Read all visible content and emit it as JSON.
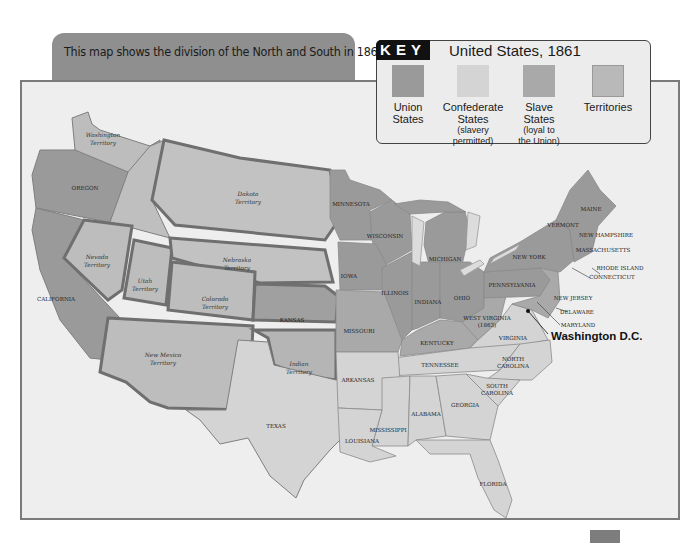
{
  "caption": "This map shows the division of the North and South in 1861.",
  "key": {
    "badge": "KEY",
    "title": "United States, 1861",
    "items": [
      {
        "label": "Union",
        "label2": "States",
        "sub": "",
        "sub2": "",
        "color": "#9a9a9a"
      },
      {
        "label": "Confederate",
        "label2": "States",
        "sub": "(slavery",
        "sub2": "permitted)",
        "color": "#d4d4d4"
      },
      {
        "label": "Slave",
        "label2": "States",
        "sub": "(loyal to",
        "sub2": "the Union)",
        "color": "#a9a9a9"
      },
      {
        "label": "Territories",
        "label2": "",
        "sub": "",
        "sub2": "",
        "color": "#b9b9b9"
      }
    ]
  },
  "colors": {
    "union": "#9a9a9a",
    "confederate": "#d4d4d4",
    "slave_loyal": "#a9a9a9",
    "territories": "#b9b9b9",
    "background": "#eeeeee",
    "border": "#7a7a7a"
  },
  "map": {
    "territories": {
      "washington": [
        "Washington",
        "Territory"
      ],
      "dakota": [
        "Dakota",
        "Territory"
      ],
      "nebraska": [
        "Nebraska",
        "Territory"
      ],
      "nevada": [
        "Nevada",
        "Territory"
      ],
      "utah": [
        "Utah",
        "Territory"
      ],
      "colorado": [
        "Colorado",
        "Territory"
      ],
      "new_mexico": [
        "New Mexico",
        "Territory"
      ],
      "indian": [
        "Indian",
        "Territory"
      ]
    },
    "states": {
      "oregon": "OREGON",
      "california": "CALIFORNIA",
      "kansas": "KANSAS",
      "texas": "TEXAS",
      "minnesota": "MINNESOTA",
      "wisconsin": "WISCONSIN",
      "iowa": "IOWA",
      "michigan": "MICHIGAN",
      "illinois": "ILLINOIS",
      "indiana": "INDIANA",
      "ohio": "OHIO",
      "missouri": "MISSOURI",
      "kentucky": "KENTUCKY",
      "west_virginia": [
        "WEST VIRGINIA",
        "(1863)"
      ],
      "virginia": "VIRGINIA",
      "tennessee": "TENNESSEE",
      "north_carolina": [
        "NORTH",
        "CAROLINA"
      ],
      "south_carolina": [
        "SOUTH",
        "CAROLINA"
      ],
      "georgia": "GEORGIA",
      "alabama": "ALABAMA",
      "mississippi": "MISSISSIPPI",
      "louisiana": "LOUISIANA",
      "arkansas": "ARKANSAS",
      "florida": "FLORIDA",
      "pennsylvania": "PENNSYLVANIA",
      "new_york": "NEW YORK",
      "maine": "MAINE",
      "vermont": "VERMONT",
      "new_hampshire": "NEW HAMPSHIRE",
      "massachusetts": "MASSACHUSETTS",
      "rhode_island": "RHODE ISLAND",
      "connecticut": "CONNECTICUT",
      "new_jersey": "NEW JERSEY",
      "delaware": "DELAWARE",
      "maryland": "MARYLAND"
    },
    "capital": "Washington D.C."
  }
}
